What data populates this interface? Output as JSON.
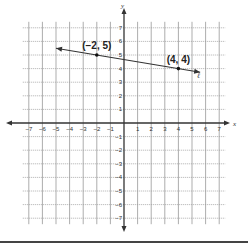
{
  "chart_data": {
    "type": "line",
    "title": "",
    "xlabel": "x",
    "ylabel": "y",
    "xlim": [
      -7,
      7
    ],
    "ylim": [
      -7,
      7
    ],
    "grid": true,
    "x_ticks": [
      -7,
      -6,
      -5,
      -4,
      -3,
      -2,
      -1,
      1,
      2,
      3,
      4,
      5,
      6,
      7
    ],
    "y_ticks": [
      -7,
      -6,
      -5,
      -4,
      -3,
      -2,
      -1,
      1,
      2,
      3,
      4,
      5,
      6,
      7
    ],
    "series": [
      {
        "name": "ℓ",
        "points": [
          [
            -2,
            5
          ],
          [
            4,
            4
          ]
        ],
        "extent_x": [
          -5,
          5.6
        ],
        "arrows": "both"
      }
    ],
    "annotations": [
      {
        "text": "(−2, 5)",
        "x": -2,
        "y": 5
      },
      {
        "text": "(4, 4)",
        "x": 4,
        "y": 4
      },
      {
        "text": "ℓ",
        "x": 5.5,
        "y": 3.3
      }
    ]
  }
}
